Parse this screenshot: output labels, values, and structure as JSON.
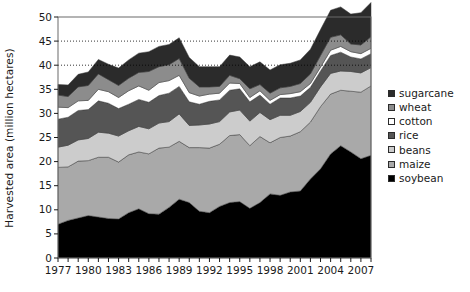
{
  "chart_data": {
    "type": "area",
    "stacked": true,
    "title": "",
    "xlabel": "",
    "ylabel": "Harvested area (million hectares)",
    "ylim": [
      0,
      50
    ],
    "ytick_step": 5,
    "yticks": [
      0,
      5,
      10,
      15,
      20,
      25,
      30,
      35,
      40,
      45,
      50
    ],
    "xlim": [
      1977,
      2008
    ],
    "xticks": [
      1977,
      1980,
      1983,
      1986,
      1989,
      1992,
      1995,
      1998,
      2001,
      2004,
      2007
    ],
    "xtick_labels": [
      "1977",
      "1980",
      "1983",
      "1986",
      "1989",
      "1992",
      "1995",
      "1998",
      "2001",
      "2004",
      "2007"
    ],
    "x": [
      1977,
      1978,
      1979,
      1980,
      1981,
      1982,
      1983,
      1984,
      1985,
      1986,
      1987,
      1988,
      1989,
      1990,
      1991,
      1992,
      1993,
      1994,
      1995,
      1996,
      1997,
      1998,
      1999,
      2000,
      2001,
      2002,
      2003,
      2004,
      2005,
      2006,
      2007,
      2008
    ],
    "grid": "dotted horizontal gridlines at 40 and 45 only",
    "gridlines": [
      40,
      45
    ],
    "legend_position": "right",
    "stack_order_bottom_to_top": [
      "soybean",
      "maize",
      "beans",
      "rice",
      "cotton",
      "wheat",
      "sugarcane"
    ],
    "series": [
      {
        "name": "soybean",
        "color": "#000000",
        "values": [
          7.0,
          7.8,
          8.3,
          8.8,
          8.5,
          8.2,
          8.1,
          9.4,
          10.2,
          9.2,
          9.1,
          10.5,
          12.2,
          11.5,
          9.7,
          9.4,
          10.7,
          11.5,
          11.7,
          10.3,
          11.5,
          13.3,
          13.0,
          13.7,
          13.9,
          16.4,
          18.5,
          21.6,
          23.3,
          22.0,
          20.6,
          21.3
        ]
      },
      {
        "name": "maize",
        "color": "#a9a9a9",
        "values": [
          11.8,
          11.1,
          11.8,
          11.4,
          12.4,
          12.7,
          11.8,
          12.0,
          11.8,
          12.4,
          13.7,
          12.5,
          12.0,
          11.4,
          13.2,
          13.4,
          12.9,
          13.9,
          13.9,
          13.0,
          13.7,
          10.6,
          12.0,
          11.6,
          12.3,
          11.8,
          12.9,
          12.4,
          11.5,
          12.6,
          13.8,
          14.4
        ]
      },
      {
        "name": "beans",
        "color": "#cccccc",
        "values": [
          4.2,
          4.5,
          4.4,
          4.6,
          5.2,
          5.0,
          5.4,
          5.0,
          5.3,
          5.2,
          5.2,
          5.3,
          5.7,
          4.6,
          4.7,
          5.0,
          4.7,
          4.9,
          5.1,
          5.1,
          5.0,
          4.8,
          4.6,
          4.3,
          4.2,
          4.1,
          4.1,
          4.3,
          4.0,
          4.1,
          4.0,
          3.8
        ]
      },
      {
        "name": "rice",
        "color": "#555555",
        "values": [
          5.8,
          5.8,
          6.1,
          6.0,
          6.5,
          6.2,
          5.7,
          5.5,
          5.6,
          5.5,
          5.7,
          5.9,
          5.7,
          4.9,
          4.3,
          4.7,
          4.5,
          4.5,
          4.4,
          4.0,
          3.6,
          3.2,
          3.6,
          3.6,
          3.2,
          3.1,
          3.3,
          3.7,
          3.9,
          3.0,
          2.9,
          2.9
        ]
      },
      {
        "name": "cotton",
        "color": "#ffffff",
        "values": [
          2.5,
          2.0,
          2.0,
          1.9,
          2.4,
          2.4,
          2.3,
          2.8,
          2.8,
          2.5,
          2.7,
          2.6,
          2.3,
          1.9,
          1.7,
          1.5,
          1.4,
          1.5,
          1.1,
          0.9,
          0.9,
          0.8,
          0.7,
          0.9,
          0.9,
          0.8,
          0.8,
          1.1,
          1.2,
          1.1,
          1.1,
          1.1
        ]
      },
      {
        "name": "wheat",
        "color": "#8c8c8c",
        "values": [
          2.5,
          2.3,
          2.9,
          3.1,
          3.2,
          2.5,
          2.5,
          2.6,
          2.8,
          3.9,
          3.3,
          3.3,
          3.5,
          3.0,
          1.9,
          1.5,
          1.4,
          1.6,
          1.0,
          1.8,
          1.3,
          1.5,
          1.4,
          1.5,
          1.7,
          2.0,
          2.4,
          2.7,
          2.4,
          1.6,
          1.8,
          2.4
        ]
      },
      {
        "name": "sugarcane",
        "color": "#2b2b2b",
        "values": [
          2.2,
          2.4,
          2.6,
          2.8,
          3.0,
          3.2,
          3.6,
          3.8,
          4.0,
          4.1,
          4.2,
          4.2,
          4.3,
          4.3,
          4.2,
          4.2,
          4.1,
          4.2,
          4.5,
          4.6,
          4.7,
          4.8,
          4.8,
          4.8,
          4.9,
          5.1,
          5.4,
          5.6,
          5.8,
          6.2,
          6.7,
          7.1
        ]
      }
    ],
    "legend_entries": [
      {
        "label": "sugarcane",
        "color": "#2b2b2b"
      },
      {
        "label": "wheat",
        "color": "#8c8c8c"
      },
      {
        "label": "cotton",
        "color": "#ffffff"
      },
      {
        "label": "rice",
        "color": "#555555"
      },
      {
        "label": "beans",
        "color": "#cccccc"
      },
      {
        "label": "maize",
        "color": "#a9a9a9"
      },
      {
        "label": "soybean",
        "color": "#000000"
      }
    ]
  }
}
